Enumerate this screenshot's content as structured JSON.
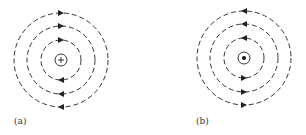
{
  "figure": {
    "panels": [
      {
        "id": "a",
        "label": "(a)",
        "center": [
          61,
          60
        ],
        "center_symbol": "plus",
        "center_description": "current into page (cross / tail of arrow)",
        "radii": [
          20,
          34,
          47
        ],
        "center_radius": 6,
        "field_direction": "clockwise",
        "top_arrow_direction": "right",
        "bottom_arrow_direction": "left",
        "label_pos": [
          14,
          124
        ]
      },
      {
        "id": "b",
        "label": "(b)",
        "center": [
          244,
          58
        ],
        "center_symbol": "dot",
        "center_description": "current out of page (dot / head of arrow)",
        "radii": [
          20,
          34,
          47
        ],
        "center_radius": 6,
        "field_direction": "counterclockwise",
        "top_arrow_direction": "left",
        "bottom_arrow_direction": "right",
        "label_pos": [
          196,
          124
        ]
      }
    ],
    "style": {
      "line_color": "#333333",
      "dash": "5 3",
      "stroke_width": 1
    }
  }
}
